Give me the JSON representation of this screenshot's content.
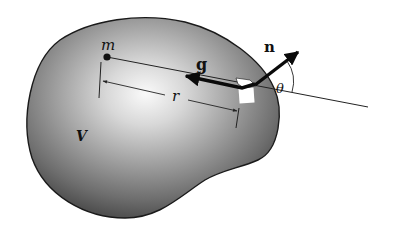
{
  "figure": {
    "labels": {
      "mass": "m",
      "field": "g",
      "normal": "n",
      "angle": "θ",
      "distance": "r",
      "volume": "V"
    },
    "colors": {
      "body_fill_light": "#f4f4f4",
      "body_fill_dark": "#5a5a5a",
      "outline": "#1a1a1a",
      "arrow": "#0a0a0a",
      "background": "#ffffff"
    }
  }
}
